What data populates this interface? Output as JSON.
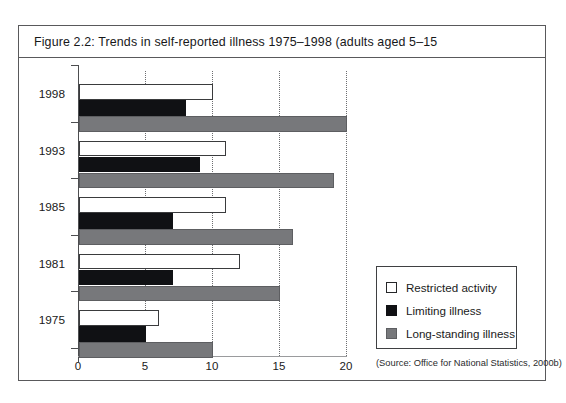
{
  "figure": {
    "caption": "Figure 2.2:  Trends in self-reported illness 1975–1998 (adults aged 5–15",
    "source_note": "(Source: Office for National Statistics, 2000b)"
  },
  "legend": {
    "items": [
      {
        "label": "Restricted activity",
        "key": "restricted",
        "color": "#ffffff"
      },
      {
        "label": "Limiting illness",
        "key": "limiting",
        "color": "#101114"
      },
      {
        "label": "Long-standing illness",
        "key": "longstanding",
        "color": "#77787b"
      }
    ]
  },
  "chart_data": {
    "type": "bar",
    "orientation": "horizontal",
    "title": "Figure 2.2:  Trends in self-reported illness 1975–1998 (adults aged 5–15",
    "xlabel": "",
    "ylabel": "",
    "categories": [
      "1998",
      "1993",
      "1985",
      "1981",
      "1975"
    ],
    "xlim": [
      0,
      20
    ],
    "xticks": [
      0,
      5,
      10,
      15,
      20
    ],
    "xtick_labels": [
      "0",
      "5",
      "10",
      "15",
      "20"
    ],
    "grid": "vertical-dotted-at-xticks",
    "legend_position": "right",
    "series": [
      {
        "name": "Restricted activity",
        "color": "#ffffff",
        "values": [
          10,
          11,
          11,
          12,
          6
        ]
      },
      {
        "name": "Limiting illness",
        "color": "#101114",
        "values": [
          8,
          9,
          7,
          7,
          5
        ]
      },
      {
        "name": "Long-standing illness",
        "color": "#77787b",
        "values": [
          20,
          19,
          16,
          15,
          10
        ]
      }
    ],
    "annotations": [
      "(Source: Office for National Statistics, 2000b)"
    ]
  }
}
